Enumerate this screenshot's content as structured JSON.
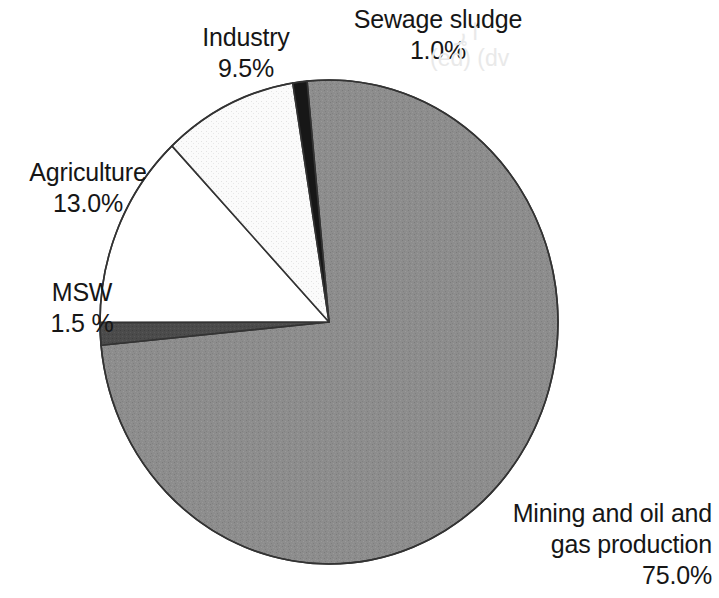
{
  "chart_data": {
    "type": "pie",
    "title": "",
    "subtitle": "",
    "xlabel": "",
    "ylabel": "",
    "legend_position": "none",
    "grid": false,
    "labels_show_percent": true,
    "start_angle_deg": -5.5,
    "direction": "clockwise",
    "categories": [
      "Mining and oil and gas production",
      "MSW",
      "Agriculture",
      "Industry",
      "Sewage sludge"
    ],
    "values": [
      75.0,
      1.5,
      13.0,
      9.5,
      1.0
    ],
    "slices": [
      {
        "name": "Mining and oil and gas production",
        "value": 75.0,
        "percent_text": "75.0%",
        "fill": "#8b8b8b",
        "pattern": "noise-gray",
        "label_lines": [
          "Mining and oil and",
          "gas production",
          "75.0%"
        ]
      },
      {
        "name": "MSW",
        "value": 1.5,
        "percent_text": "1.5 %",
        "fill": "#4a4a4a",
        "pattern": "solid-dark-gray",
        "label_lines": [
          "MSW",
          "1.5 %"
        ]
      },
      {
        "name": "Agriculture",
        "value": 13.0,
        "percent_text": "13.0%",
        "fill": "#ffffff",
        "pattern": "solid-white",
        "label_lines": [
          "Agriculture",
          "13.0%"
        ]
      },
      {
        "name": "Industry",
        "value": 9.5,
        "percent_text": "9.5%",
        "fill": "#f4f4f4",
        "pattern": "fine-dots",
        "label_lines": [
          "Industry",
          "9.5%"
        ]
      },
      {
        "name": "Sewage sludge",
        "value": 1.0,
        "percent_text": "1.0%",
        "fill": "#171717",
        "pattern": "solid-black",
        "label_lines": [
          "Sewage sludge",
          "1.0%"
        ]
      }
    ],
    "geometry": {
      "center_x": 329,
      "center_y": 322,
      "radius_x": 229,
      "radius_y": 242,
      "outline_color": "#333333",
      "outline_width": 1.6
    }
  },
  "labels": {
    "industry": {
      "name": "Industry",
      "value": "9.5%"
    },
    "sewage_sludge": {
      "name": "Sewage sludge",
      "value": "1.0%"
    },
    "agriculture": {
      "name": "Agriculture",
      "value": "13.0%"
    },
    "msw": {
      "name": "MSW",
      "value": "1.5 %"
    },
    "mining": {
      "line1": "Mining and oil and",
      "line2": "gas production",
      "value": "75.0%"
    }
  },
  "artifacts": {
    "ghost_text_1": "ا ړ",
    "ghost_text_2": "(ed) (dv"
  }
}
